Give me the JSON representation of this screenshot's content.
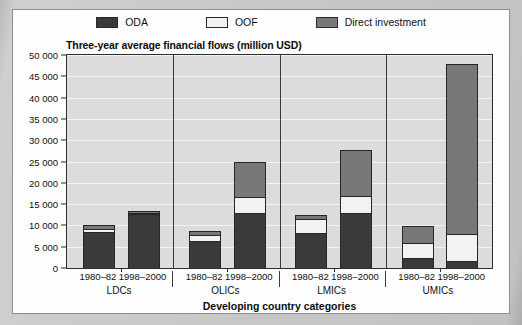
{
  "chart_data": {
    "type": "bar",
    "subtype": "stacked-grouped",
    "title": "Three-year average financial flows (million USD)",
    "xlabel": "Developing country categories",
    "ylabel": "",
    "ylim": [
      0,
      50000
    ],
    "ytick_step": 5000,
    "grid": true,
    "legend_position": "top-center",
    "ytick_labels": [
      "0",
      "5 000",
      "10 000",
      "15 000",
      "20 000",
      "25 000",
      "30 000",
      "35 000",
      "40 000",
      "45 000",
      "50 000"
    ],
    "ytick_values": [
      0,
      5000,
      10000,
      15000,
      20000,
      25000,
      30000,
      35000,
      40000,
      45000,
      50000
    ],
    "groups": [
      "LDCs",
      "OLICs",
      "LMICs",
      "UMICs"
    ],
    "periods": [
      "1980–82",
      "1998–2000"
    ],
    "categories": [
      "LDCs 1980–82",
      "LDCs 1998–2000",
      "OLICs 1980–82",
      "OLICs 1998–2000",
      "LMICs 1980–82",
      "LMICs 1998–2000",
      "UMICs 1980–82",
      "UMICs 1998–2000"
    ],
    "series": [
      {
        "name": "ODA",
        "color": "#3a3a3a",
        "values": [
          8500,
          12700,
          6200,
          12900,
          8200,
          12800,
          2200,
          1400
        ]
      },
      {
        "name": "OOF",
        "color": "#f2f2f2",
        "values": [
          700,
          200,
          1500,
          3600,
          3400,
          3900,
          3500,
          6400
        ]
      },
      {
        "name": "Direct investment",
        "color": "#787878",
        "values": [
          800,
          600,
          1100,
          8300,
          800,
          11000,
          4200,
          40000
        ]
      }
    ],
    "totals": [
      10000,
      13500,
      8800,
      24800,
      12400,
      27700,
      9900,
      47800
    ]
  },
  "legend": {
    "items": [
      {
        "label": "ODA",
        "color": "#3a3a3a"
      },
      {
        "label": "OOF",
        "color": "#f2f2f2"
      },
      {
        "label": "Direct investment",
        "color": "#787878"
      }
    ]
  }
}
